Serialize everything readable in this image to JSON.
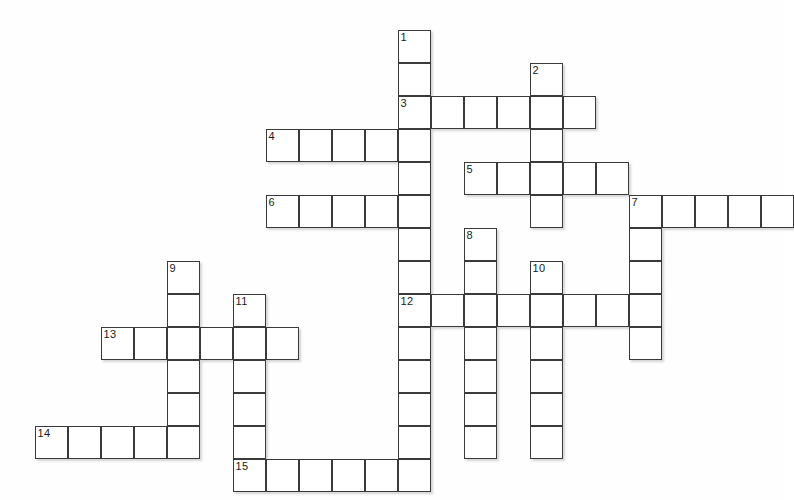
{
  "puzzle": {
    "title": "Crossword Puzzle Grid",
    "grid": {
      "cell_size": 33,
      "origin_x": 35,
      "origin_y": 30,
      "columns": 23,
      "rows": 14,
      "background_color": "#ffffff",
      "cell_fill_color": "#ffffff",
      "cell_border_color": "#3a3a3a",
      "number_color": "#1a1a1a",
      "shadow_color": "#787879"
    },
    "entries": [
      {
        "number": "1",
        "direction": "down",
        "col": 11,
        "row": 0,
        "length": 13,
        "label": "1",
        "answer": ""
      },
      {
        "number": "2",
        "direction": "down",
        "col": 15,
        "row": 1,
        "length": 5,
        "label": "2",
        "answer": ""
      },
      {
        "number": "3",
        "direction": "across",
        "col": 11,
        "row": 2,
        "length": 6,
        "label": "3",
        "answer": ""
      },
      {
        "number": "4",
        "direction": "across",
        "col": 7,
        "row": 3,
        "length": 5,
        "label": "4",
        "answer": ""
      },
      {
        "number": "5",
        "direction": "across",
        "col": 13,
        "row": 4,
        "length": 5,
        "label": "5",
        "answer": ""
      },
      {
        "number": "6",
        "direction": "across",
        "col": 7,
        "row": 5,
        "length": 5,
        "label": "6",
        "answer": ""
      },
      {
        "number": "7",
        "direction": "across",
        "col": 18,
        "row": 5,
        "length": 5,
        "label": "7",
        "answer": ""
      },
      {
        "number": "7",
        "direction": "down",
        "col": 18,
        "row": 5,
        "length": 4,
        "label": "7",
        "answer": ""
      },
      {
        "number": "8",
        "direction": "down",
        "col": 13,
        "row": 6,
        "length": 7,
        "label": "8",
        "answer": ""
      },
      {
        "number": "9",
        "direction": "down",
        "col": 4,
        "row": 7,
        "length": 6,
        "label": "9",
        "answer": ""
      },
      {
        "number": "10",
        "direction": "down",
        "col": 15,
        "row": 7,
        "length": 6,
        "label": "10",
        "answer": ""
      },
      {
        "number": "11",
        "direction": "down",
        "col": 6,
        "row": 8,
        "length": 6,
        "label": "11",
        "answer": ""
      },
      {
        "number": "12",
        "direction": "across",
        "col": 11,
        "row": 8,
        "length": 7,
        "label": "12",
        "answer": ""
      },
      {
        "number": "13",
        "direction": "across",
        "col": 2,
        "row": 9,
        "length": 6,
        "label": "13",
        "answer": ""
      },
      {
        "number": "14",
        "direction": "across",
        "col": 0,
        "row": 12,
        "length": 5,
        "label": "14",
        "answer": ""
      },
      {
        "number": "15",
        "direction": "across",
        "col": 6,
        "row": 13,
        "length": 6,
        "label": "15",
        "answer": ""
      }
    ],
    "numbered_cells": [
      {
        "label": "1",
        "col": 11,
        "row": 0
      },
      {
        "label": "2",
        "col": 15,
        "row": 1
      },
      {
        "label": "3",
        "col": 11,
        "row": 2
      },
      {
        "label": "4",
        "col": 7,
        "row": 3
      },
      {
        "label": "5",
        "col": 13,
        "row": 4
      },
      {
        "label": "6",
        "col": 7,
        "row": 5
      },
      {
        "label": "7",
        "col": 18,
        "row": 5
      },
      {
        "label": "8",
        "col": 13,
        "row": 6
      },
      {
        "label": "9",
        "col": 4,
        "row": 7
      },
      {
        "label": "10",
        "col": 15,
        "row": 7
      },
      {
        "label": "11",
        "col": 6,
        "row": 8
      },
      {
        "label": "12",
        "col": 11,
        "row": 8
      },
      {
        "label": "13",
        "col": 2,
        "row": 9
      },
      {
        "label": "14",
        "col": 0,
        "row": 12
      },
      {
        "label": "15",
        "col": 6,
        "row": 13
      }
    ],
    "cells": [
      {
        "col": 11,
        "row": 0
      },
      {
        "col": 11,
        "row": 1
      },
      {
        "col": 15,
        "row": 1
      },
      {
        "col": 11,
        "row": 2
      },
      {
        "col": 12,
        "row": 2
      },
      {
        "col": 13,
        "row": 2
      },
      {
        "col": 14,
        "row": 2
      },
      {
        "col": 15,
        "row": 2
      },
      {
        "col": 16,
        "row": 2
      },
      {
        "col": 7,
        "row": 3
      },
      {
        "col": 8,
        "row": 3
      },
      {
        "col": 9,
        "row": 3
      },
      {
        "col": 10,
        "row": 3
      },
      {
        "col": 11,
        "row": 3
      },
      {
        "col": 15,
        "row": 3
      },
      {
        "col": 11,
        "row": 4
      },
      {
        "col": 13,
        "row": 4
      },
      {
        "col": 14,
        "row": 4
      },
      {
        "col": 15,
        "row": 4
      },
      {
        "col": 16,
        "row": 4
      },
      {
        "col": 17,
        "row": 4
      },
      {
        "col": 7,
        "row": 5
      },
      {
        "col": 8,
        "row": 5
      },
      {
        "col": 9,
        "row": 5
      },
      {
        "col": 10,
        "row": 5
      },
      {
        "col": 11,
        "row": 5
      },
      {
        "col": 15,
        "row": 5
      },
      {
        "col": 18,
        "row": 5
      },
      {
        "col": 19,
        "row": 5
      },
      {
        "col": 20,
        "row": 5
      },
      {
        "col": 21,
        "row": 5
      },
      {
        "col": 22,
        "row": 5
      },
      {
        "col": 11,
        "row": 6
      },
      {
        "col": 13,
        "row": 6
      },
      {
        "col": 18,
        "row": 6
      },
      {
        "col": 4,
        "row": 7
      },
      {
        "col": 11,
        "row": 7
      },
      {
        "col": 13,
        "row": 7
      },
      {
        "col": 15,
        "row": 7
      },
      {
        "col": 18,
        "row": 7
      },
      {
        "col": 4,
        "row": 8
      },
      {
        "col": 6,
        "row": 8
      },
      {
        "col": 11,
        "row": 8
      },
      {
        "col": 12,
        "row": 8
      },
      {
        "col": 13,
        "row": 8
      },
      {
        "col": 14,
        "row": 8
      },
      {
        "col": 15,
        "row": 8
      },
      {
        "col": 16,
        "row": 8
      },
      {
        "col": 17,
        "row": 8
      },
      {
        "col": 18,
        "row": 8
      },
      {
        "col": 2,
        "row": 9
      },
      {
        "col": 3,
        "row": 9
      },
      {
        "col": 4,
        "row": 9
      },
      {
        "col": 5,
        "row": 9
      },
      {
        "col": 6,
        "row": 9
      },
      {
        "col": 7,
        "row": 9
      },
      {
        "col": 11,
        "row": 9
      },
      {
        "col": 13,
        "row": 9
      },
      {
        "col": 15,
        "row": 9
      },
      {
        "col": 18,
        "row": 9
      },
      {
        "col": 4,
        "row": 10
      },
      {
        "col": 6,
        "row": 10
      },
      {
        "col": 11,
        "row": 10
      },
      {
        "col": 13,
        "row": 10
      },
      {
        "col": 15,
        "row": 10
      },
      {
        "col": 4,
        "row": 11
      },
      {
        "col": 6,
        "row": 11
      },
      {
        "col": 11,
        "row": 11
      },
      {
        "col": 13,
        "row": 11
      },
      {
        "col": 15,
        "row": 11
      },
      {
        "col": 0,
        "row": 12
      },
      {
        "col": 1,
        "row": 12
      },
      {
        "col": 2,
        "row": 12
      },
      {
        "col": 3,
        "row": 12
      },
      {
        "col": 4,
        "row": 12
      },
      {
        "col": 6,
        "row": 12
      },
      {
        "col": 11,
        "row": 12
      },
      {
        "col": 13,
        "row": 12
      },
      {
        "col": 15,
        "row": 12
      },
      {
        "col": 6,
        "row": 13
      },
      {
        "col": 7,
        "row": 13
      },
      {
        "col": 8,
        "row": 13
      },
      {
        "col": 9,
        "row": 13
      },
      {
        "col": 10,
        "row": 13
      },
      {
        "col": 11,
        "row": 13
      }
    ]
  }
}
